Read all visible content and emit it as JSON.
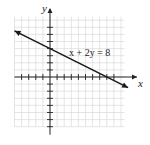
{
  "chart_data": {
    "type": "line",
    "title": "",
    "xlabel": "x",
    "ylabel": "y",
    "equation_label": "x + 2y = 8",
    "xlim": [
      -5,
      11
    ],
    "ylim": [
      -7,
      9
    ],
    "grid": true,
    "tick_spacing": 1,
    "series": [
      {
        "name": "x + 2y = 8",
        "slope": -0.5,
        "intercept": 4,
        "x_intercept": 8,
        "y_intercept": 4,
        "x": [
          -5,
          0,
          8,
          11
        ],
        "y": [
          6.5,
          4,
          0,
          -1.5
        ]
      }
    ],
    "colors": {
      "line": "#1a1a1a",
      "grid": "#d4d4d4",
      "axis": "#222222"
    }
  }
}
